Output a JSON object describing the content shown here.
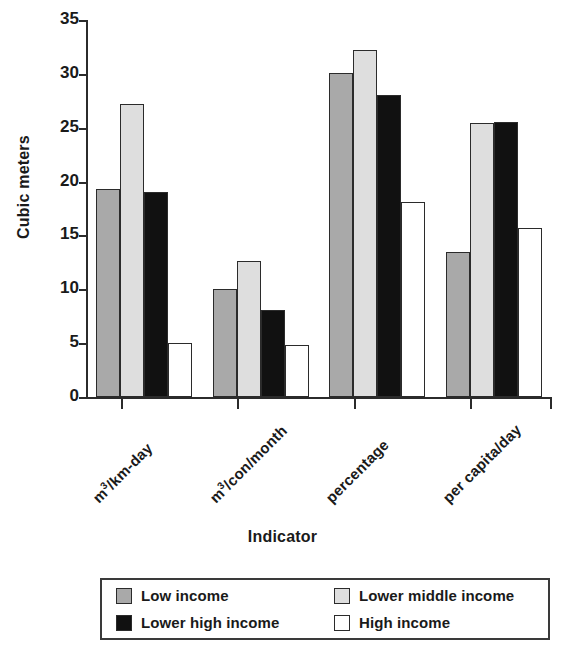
{
  "chart_data": {
    "type": "bar",
    "title": "",
    "xlabel": "Indicator",
    "ylabel": "Cubic meters",
    "ylim": [
      0,
      35
    ],
    "yticks": [
      0,
      5,
      10,
      15,
      20,
      25,
      30,
      35
    ],
    "grid": false,
    "legend_position": "bottom",
    "categories": [
      "m³/km-day",
      "m³/con/month",
      "percentage",
      "per capita/day"
    ],
    "category_labels": [
      {
        "prefix": "m",
        "sup": "3",
        "suffix": "/km-day"
      },
      {
        "prefix": "m",
        "sup": "3",
        "suffix": "/con/month"
      },
      {
        "prefix": "percentage",
        "sup": "",
        "suffix": ""
      },
      {
        "prefix": "per capita/day",
        "sup": "",
        "suffix": ""
      }
    ],
    "series": [
      {
        "name": "Low income",
        "color": "#a9a9a9",
        "values": [
          19.3,
          10.0,
          30.1,
          13.5
        ]
      },
      {
        "name": "Lower middle income",
        "color": "#dedede",
        "values": [
          27.2,
          12.6,
          32.2,
          25.4
        ]
      },
      {
        "name": "Lower high income",
        "color": "#111111",
        "values": [
          19.0,
          8.1,
          28.0,
          25.5
        ]
      },
      {
        "name": "High income",
        "color": "#ffffff",
        "values": [
          5.0,
          4.8,
          18.1,
          15.7
        ]
      }
    ]
  },
  "axes": {
    "y_title": "Cubic meters",
    "x_title": "Indicator",
    "y_tick_labels": [
      "0",
      "5",
      "10",
      "15",
      "20",
      "25",
      "30",
      "35"
    ]
  },
  "legend": {
    "items": [
      {
        "label": "Low income",
        "swatch": "low"
      },
      {
        "label": "Lower middle income",
        "swatch": "lowmid"
      },
      {
        "label": "Lower high income",
        "swatch": "lowhigh"
      },
      {
        "label": "High income",
        "swatch": "high"
      }
    ]
  }
}
